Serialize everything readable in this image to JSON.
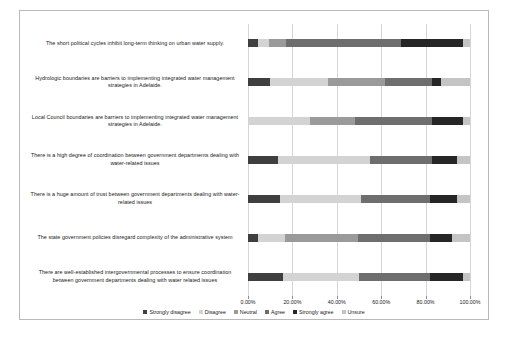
{
  "chart_data": {
    "type": "bar",
    "orientation": "horizontal",
    "stacked": true,
    "normalized": true,
    "title": "",
    "xlabel": "",
    "ylabel": "",
    "xlim": [
      0,
      100
    ],
    "xticks": [
      "0.00%",
      "20.00%",
      "40.00%",
      "60.00%",
      "80.00%",
      "100.00%"
    ],
    "xtick_values": [
      0,
      20,
      40,
      60,
      80,
      100
    ],
    "grid": true,
    "legend_position": "bottom",
    "series": [
      {
        "name": "Strongly disagree",
        "color": "#3f3f3f",
        "values": [
          4.5,
          10.0,
          0.0,
          13.6,
          14.5,
          4.5,
          15.9
        ]
      },
      {
        "name": "Disagree",
        "color": "#d3d3d3",
        "values": [
          5.0,
          26.0,
          27.8,
          41.4,
          36.5,
          12.0,
          34.1
        ]
      },
      {
        "name": "Neutral",
        "color": "#9a9a9a",
        "values": [
          7.5,
          25.5,
          20.2,
          0.0,
          0.0,
          33.0,
          0.0
        ]
      },
      {
        "name": "Agree",
        "color": "#6e6e6e",
        "values": [
          52.0,
          21.5,
          35.0,
          28.0,
          31.0,
          32.5,
          32.0
        ]
      },
      {
        "name": "Strongly agree",
        "color": "#262626",
        "values": [
          28.0,
          4.0,
          14.0,
          11.0,
          12.0,
          10.0,
          15.0
        ]
      },
      {
        "name": "Unsure",
        "color": "#c4c4c4",
        "values": [
          3.0,
          13.0,
          3.0,
          6.0,
          6.0,
          8.0,
          3.0
        ]
      }
    ],
    "categories": [
      "The short political cycles inhibit long-term thinking on urban water supply.",
      "Hydrologic boundaries are barriers to implementing integrated water management strategies in Adelaide.",
      "Local Council boundaries are barriers to implementing integrated water management strategies in Adelaide.",
      "There is a high degree of coordination between government departments dealing with water-related issues",
      "There is a huge amount of trust between government departments dealing with water-related issues",
      "The state government policies disregard complexity of the administrative system",
      "There are well-established intergovernmental processes to ensure coordination between government departments dealing with water related issues"
    ]
  },
  "legend": {
    "items": [
      {
        "label": "Strongly disagree",
        "color": "#3f3f3f"
      },
      {
        "label": "Disagree",
        "color": "#d3d3d3"
      },
      {
        "label": "Neutral",
        "color": "#9a9a9a"
      },
      {
        "label": "Agree",
        "color": "#6e6e6e"
      },
      {
        "label": "Strongly agree",
        "color": "#262626"
      },
      {
        "label": "Unsure",
        "color": "#c4c4c4"
      }
    ]
  },
  "caption": ""
}
